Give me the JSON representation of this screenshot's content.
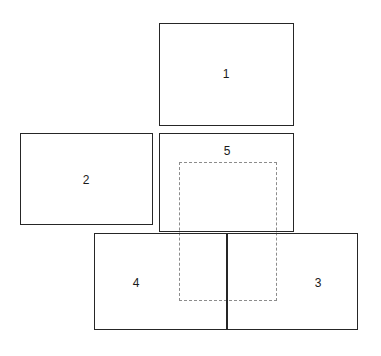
{
  "diagram": {
    "canvas": {
      "width": 381,
      "height": 356,
      "background": "#ffffff"
    },
    "stroke_color": "#262626",
    "dashed_stroke_color": "#8c8c8c",
    "label_color": "#1a1a1a",
    "panels": [
      {
        "id": "panel-1",
        "label": "1",
        "x": 159,
        "y": 23,
        "width": 135,
        "height": 103,
        "label_x": 226,
        "label_y": 68
      },
      {
        "id": "panel-2",
        "label": "2",
        "x": 20,
        "y": 133,
        "width": 133,
        "height": 92,
        "label_x": 86,
        "label_y": 174
      },
      {
        "id": "panel-5",
        "label": "5",
        "x": 159,
        "y": 133,
        "width": 135,
        "height": 99,
        "label_x": 227,
        "label_y": 145
      },
      {
        "id": "panel-4",
        "label": "4",
        "x": 94,
        "y": 233,
        "width": 133,
        "height": 97,
        "label_x": 136,
        "label_y": 277
      },
      {
        "id": "panel-3",
        "label": "3",
        "x": 227,
        "y": 233,
        "width": 131,
        "height": 97,
        "label_x": 318,
        "label_y": 277
      }
    ],
    "dashed_region": {
      "id": "dashed-selection",
      "x": 179,
      "y": 162,
      "width": 98,
      "height": 139
    }
  }
}
